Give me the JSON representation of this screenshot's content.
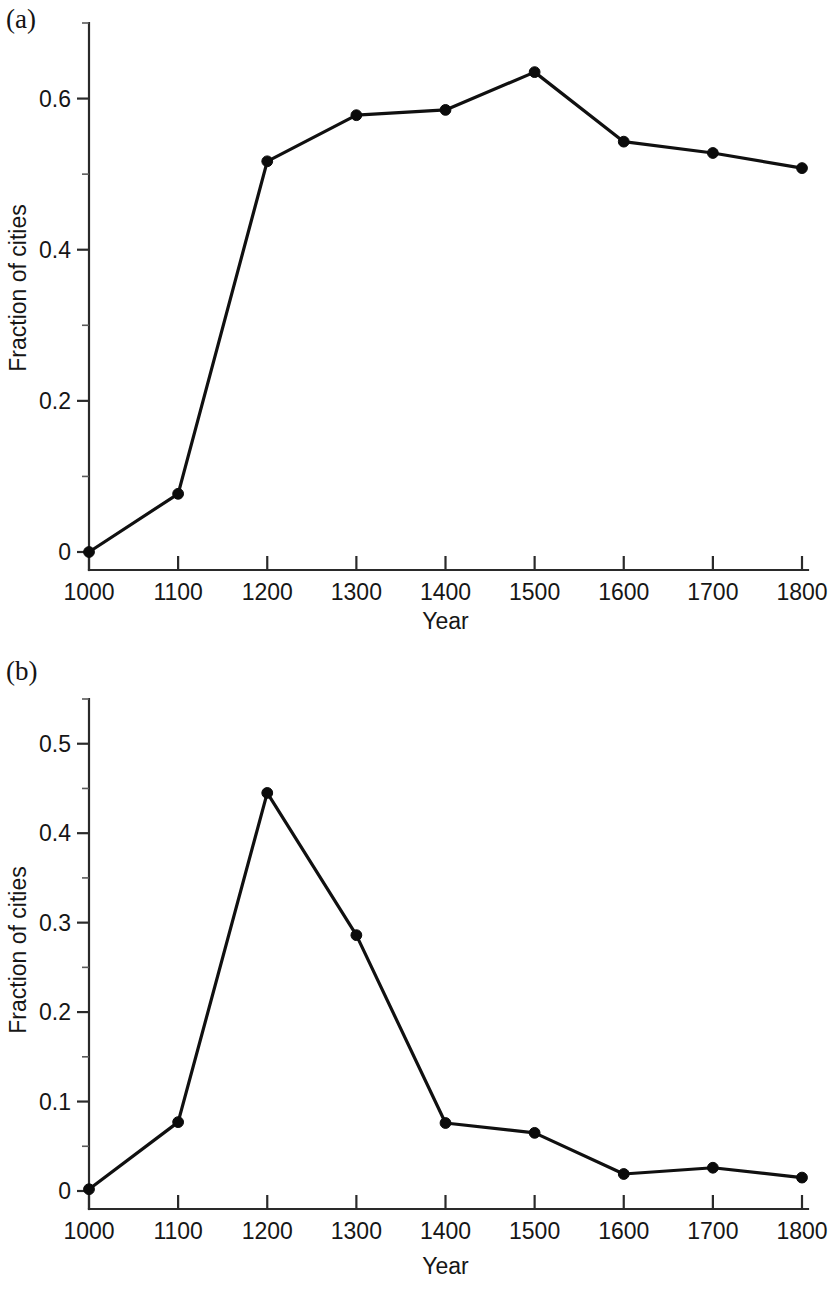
{
  "figure": {
    "panel_a_label": "(a)",
    "panel_b_label": "(b)",
    "axis_title_x": "Year",
    "axis_title_y": "Fraction of cities",
    "line_color": "#101010",
    "marker_color": "#0b0b0b",
    "axis_color": "#2a2a2a",
    "background_color": "#ffffff"
  },
  "chart_data": [
    {
      "type": "line",
      "panel": "(a)",
      "title": "",
      "xlabel": "Year",
      "ylabel": "Fraction of cities",
      "x": [
        1000,
        1100,
        1200,
        1300,
        1400,
        1500,
        1600,
        1700,
        1800
      ],
      "values": [
        0.0,
        0.077,
        0.517,
        0.578,
        0.585,
        0.635,
        0.543,
        0.528,
        0.508
      ],
      "series": [
        {
          "name": "Fraction of cities",
          "values": [
            0.0,
            0.077,
            0.517,
            0.578,
            0.585,
            0.635,
            0.543,
            0.528,
            0.508
          ]
        }
      ],
      "xtick_labels": [
        "1000",
        "1100",
        "1200",
        "1300",
        "1400",
        "1500",
        "1600",
        "1700",
        "1800"
      ],
      "xticks": [
        1000,
        1100,
        1200,
        1300,
        1400,
        1500,
        1600,
        1700,
        1800
      ],
      "ytick_labels": [
        "0",
        "0.2",
        "0.4",
        "0.6"
      ],
      "yticks": [
        0,
        0.2,
        0.4,
        0.6
      ],
      "y_minor_ticks": [
        0.1,
        0.3,
        0.5,
        0.7
      ],
      "xlim": [
        1000,
        1800
      ],
      "ylim": [
        0,
        0.7
      ],
      "grid": false,
      "legend": false,
      "markers": "filled-circle"
    },
    {
      "type": "line",
      "panel": "(b)",
      "title": "",
      "xlabel": "Year",
      "ylabel": "Fraction of cities",
      "x": [
        1000,
        1100,
        1200,
        1300,
        1400,
        1500,
        1600,
        1700,
        1800
      ],
      "values": [
        0.002,
        0.077,
        0.445,
        0.286,
        0.076,
        0.065,
        0.019,
        0.026,
        0.015
      ],
      "series": [
        {
          "name": "Fraction of cities",
          "values": [
            0.002,
            0.077,
            0.445,
            0.286,
            0.076,
            0.065,
            0.019,
            0.026,
            0.015
          ]
        }
      ],
      "xtick_labels": [
        "1000",
        "1100",
        "1200",
        "1300",
        "1400",
        "1500",
        "1600",
        "1700",
        "1800"
      ],
      "xticks": [
        1000,
        1100,
        1200,
        1300,
        1400,
        1500,
        1600,
        1700,
        1800
      ],
      "ytick_labels": [
        "0",
        "0.1",
        "0.2",
        "0.3",
        "0.4",
        "0.5"
      ],
      "yticks": [
        0,
        0.1,
        0.2,
        0.3,
        0.4,
        0.5
      ],
      "y_minor_ticks": [
        0.05,
        0.15,
        0.25,
        0.35,
        0.45,
        0.55
      ],
      "xlim": [
        1000,
        1800
      ],
      "ylim": [
        0,
        0.55
      ],
      "grid": false,
      "legend": false,
      "markers": "filled-circle"
    }
  ]
}
